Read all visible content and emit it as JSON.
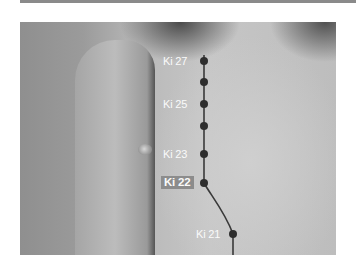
{
  "figure": {
    "points": [
      {
        "label": "Ki 27",
        "x": 184,
        "y": 39,
        "highlighted": false
      },
      {
        "label": "",
        "x": 184,
        "y": 60,
        "highlighted": false
      },
      {
        "label": "Ki 25",
        "x": 184,
        "y": 82,
        "highlighted": false
      },
      {
        "label": "",
        "x": 184,
        "y": 104,
        "highlighted": false
      },
      {
        "label": "Ki 23",
        "x": 184,
        "y": 132,
        "highlighted": false
      },
      {
        "label": "Ki 22",
        "x": 184,
        "y": 161,
        "highlighted": true
      },
      {
        "label": "Ki 21",
        "x": 213,
        "y": 212,
        "highlighted": false
      }
    ],
    "colors": {
      "point": "#2e2e2e",
      "line": "#3a3a3a",
      "label_text": "#fafafa",
      "highlight_bg": "#8c8c8c"
    }
  }
}
